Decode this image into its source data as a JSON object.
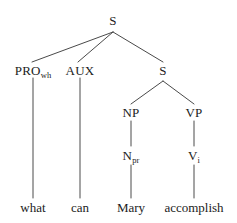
{
  "figure": {
    "kind": "syntax-tree",
    "sentence": "what can Mary accomplish",
    "stroke_color": "#4a4a4a",
    "text_color": "#1c1c1c",
    "background_color": "#ffffff"
  },
  "nodes": {
    "root_s": {
      "label": "S",
      "x": 113,
      "y": 20
    },
    "pro_wh": {
      "base": "PRO",
      "sub": "wh",
      "x": 33,
      "y": 70
    },
    "aux": {
      "label": "AUX",
      "x": 80,
      "y": 70
    },
    "embedded_s": {
      "label": "S",
      "x": 163,
      "y": 70
    },
    "np": {
      "label": "NP",
      "x": 131,
      "y": 112
    },
    "vp": {
      "label": "VP",
      "x": 194,
      "y": 112
    },
    "n_pr": {
      "base": "N",
      "sub": "pr",
      "x": 131,
      "y": 155
    },
    "v_i": {
      "base": "V",
      "sub": "i",
      "x": 194,
      "y": 155
    }
  },
  "leaves": [
    {
      "label": "what",
      "x": 33,
      "y": 207
    },
    {
      "label": "can",
      "x": 80,
      "y": 207
    },
    {
      "label": "Mary",
      "x": 131,
      "y": 207
    },
    {
      "label": "accomplish",
      "x": 194,
      "y": 207
    }
  ],
  "edges": [
    {
      "from": "root_s",
      "to": "pro_wh",
      "x1": 113,
      "y1": 32,
      "x2": 32,
      "y2": 62
    },
    {
      "from": "root_s",
      "to": "aux",
      "x1": 113,
      "y1": 32,
      "x2": 78,
      "y2": 62
    },
    {
      "from": "root_s",
      "to": "embedded_s",
      "x1": 113,
      "y1": 32,
      "x2": 163,
      "y2": 62
    },
    {
      "from": "pro_wh",
      "to": "what",
      "x1": 33,
      "y1": 78,
      "x2": 33,
      "y2": 198
    },
    {
      "from": "aux",
      "to": "can",
      "x1": 80,
      "y1": 78,
      "x2": 80,
      "y2": 198
    },
    {
      "from": "embedded_s",
      "to": "np",
      "x1": 163,
      "y1": 81,
      "x2": 131,
      "y2": 104
    },
    {
      "from": "embedded_s",
      "to": "vp",
      "x1": 163,
      "y1": 81,
      "x2": 194,
      "y2": 104
    },
    {
      "from": "np",
      "to": "n_pr",
      "x1": 131,
      "y1": 121,
      "x2": 131,
      "y2": 146
    },
    {
      "from": "vp",
      "to": "v_i",
      "x1": 194,
      "y1": 121,
      "x2": 194,
      "y2": 146
    },
    {
      "from": "n_pr",
      "to": "mary",
      "x1": 131,
      "y1": 165,
      "x2": 131,
      "y2": 198
    },
    {
      "from": "v_i",
      "to": "accomplish",
      "x1": 194,
      "y1": 165,
      "x2": 194,
      "y2": 198
    }
  ]
}
